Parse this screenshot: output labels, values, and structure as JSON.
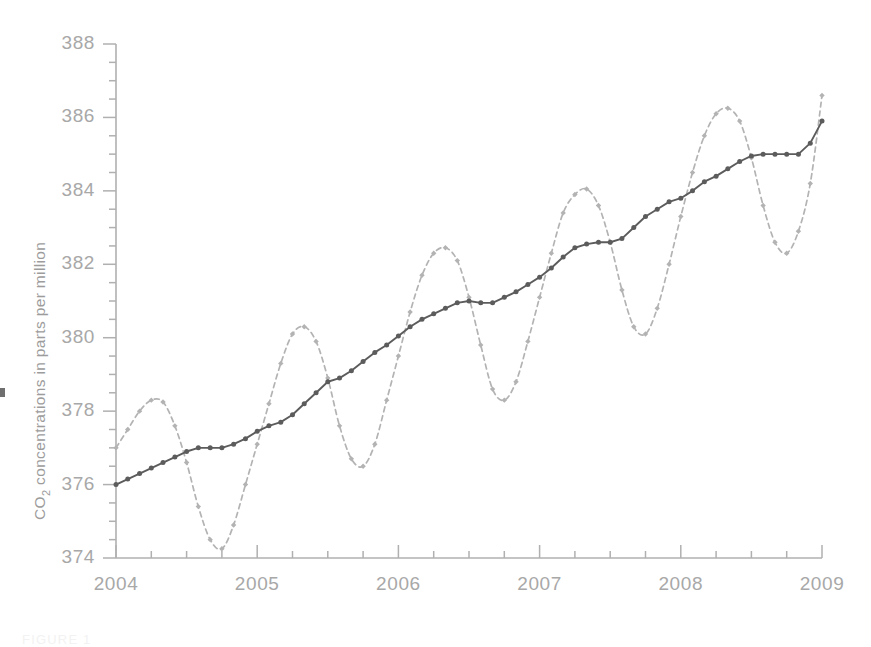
{
  "figure": {
    "caption": "FIGURE 1",
    "background_color": "#ffffff"
  },
  "axis": {
    "y_title_main": "CO",
    "y_title_sub": "2",
    "y_title_rest": " concentrations in parts per million",
    "y_ticks": [
      "374",
      "376",
      "378",
      "380",
      "382",
      "384",
      "386",
      "388"
    ],
    "x_ticks": [
      "2004",
      "2005",
      "2006",
      "2007",
      "2008",
      "2009"
    ],
    "axis_color": "#b0b0b0",
    "tick_label_color": "#a8a8a8"
  },
  "chart_data": {
    "type": "line",
    "title": "",
    "xlabel": "",
    "ylabel": "CO2 concentrations in parts per million",
    "xlim": [
      2004,
      2009
    ],
    "ylim": [
      374,
      388
    ],
    "y_major_step": 2,
    "y_minor_step": 0.5,
    "x_major_step": 1,
    "x_minor_step": 0.25,
    "grid": false,
    "legend": "none",
    "series": [
      {
        "name": "Monthly CO2 concentration",
        "style": "dashed",
        "color": "#b3b3b3",
        "marker": "diamond",
        "x": [
          2004.0,
          2004.083,
          2004.167,
          2004.25,
          2004.333,
          2004.417,
          2004.5,
          2004.583,
          2004.667,
          2004.75,
          2004.833,
          2004.917,
          2005.0,
          2005.083,
          2005.167,
          2005.25,
          2005.333,
          2005.417,
          2005.5,
          2005.583,
          2005.667,
          2005.75,
          2005.833,
          2005.917,
          2006.0,
          2006.083,
          2006.167,
          2006.25,
          2006.333,
          2006.417,
          2006.5,
          2006.583,
          2006.667,
          2006.75,
          2006.833,
          2006.917,
          2007.0,
          2007.083,
          2007.167,
          2007.25,
          2007.333,
          2007.417,
          2007.5,
          2007.583,
          2007.667,
          2007.75,
          2007.833,
          2007.917,
          2008.0,
          2008.083,
          2008.167,
          2008.25,
          2008.333,
          2008.417,
          2008.5,
          2008.583,
          2008.667,
          2008.75,
          2008.833,
          2008.917,
          2009.0
        ],
        "y": [
          377.0,
          377.5,
          378.0,
          378.3,
          378.25,
          377.6,
          376.6,
          375.4,
          374.5,
          374.25,
          374.9,
          376.0,
          377.1,
          378.2,
          379.3,
          380.1,
          380.3,
          379.9,
          378.9,
          377.6,
          376.7,
          376.5,
          377.1,
          378.3,
          379.5,
          380.7,
          381.7,
          382.3,
          382.45,
          382.1,
          381.1,
          379.8,
          378.6,
          378.3,
          378.8,
          379.9,
          381.1,
          382.3,
          383.4,
          383.9,
          384.05,
          383.6,
          382.6,
          381.3,
          380.3,
          380.1,
          380.8,
          382.0,
          383.3,
          384.5,
          385.5,
          386.1,
          386.25,
          385.9,
          384.9,
          383.6,
          382.6,
          382.3,
          382.9,
          384.2,
          386.6
        ]
      },
      {
        "name": "Trend (seasonally adjusted)",
        "style": "solid",
        "color": "#5c5c5c",
        "marker": "circle",
        "x": [
          2004.0,
          2004.083,
          2004.167,
          2004.25,
          2004.333,
          2004.417,
          2004.5,
          2004.583,
          2004.667,
          2004.75,
          2004.833,
          2004.917,
          2005.0,
          2005.083,
          2005.167,
          2005.25,
          2005.333,
          2005.417,
          2005.5,
          2005.583,
          2005.667,
          2005.75,
          2005.833,
          2005.917,
          2006.0,
          2006.083,
          2006.167,
          2006.25,
          2006.333,
          2006.417,
          2006.5,
          2006.583,
          2006.667,
          2006.75,
          2006.833,
          2006.917,
          2007.0,
          2007.083,
          2007.167,
          2007.25,
          2007.333,
          2007.417,
          2007.5,
          2007.583,
          2007.667,
          2007.75,
          2007.833,
          2007.917,
          2008.0,
          2008.083,
          2008.167,
          2008.25,
          2008.333,
          2008.417,
          2008.5,
          2008.583,
          2008.667,
          2008.75,
          2008.833,
          2008.917,
          2009.0
        ],
        "y": [
          376.0,
          376.15,
          376.3,
          376.45,
          376.6,
          376.75,
          376.9,
          377.0,
          377.0,
          377.0,
          377.1,
          377.25,
          377.45,
          377.6,
          377.7,
          377.9,
          378.2,
          378.5,
          378.8,
          378.9,
          379.1,
          379.35,
          379.6,
          379.8,
          380.05,
          380.3,
          380.5,
          380.65,
          380.8,
          380.95,
          381.0,
          380.95,
          380.95,
          381.1,
          381.25,
          381.45,
          381.65,
          381.9,
          382.2,
          382.45,
          382.55,
          382.6,
          382.6,
          382.7,
          383.0,
          383.3,
          383.5,
          383.7,
          383.8,
          384.0,
          384.25,
          384.4,
          384.6,
          384.8,
          384.95,
          385.0,
          385.0,
          385.0,
          385.0,
          385.3,
          385.9
        ]
      }
    ]
  }
}
